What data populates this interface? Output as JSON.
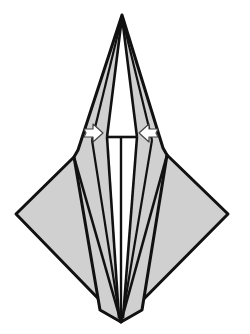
{
  "diagram": {
    "colors": {
      "paper": "#cfcfcf",
      "inner": "#ffffff",
      "stroke": "#111111",
      "background": "#ffffff"
    },
    "arrows": [
      {
        "name": "left-arrow",
        "direction": "right",
        "label": "push-in"
      },
      {
        "name": "right-arrow",
        "direction": "left",
        "label": "push-in"
      }
    ]
  }
}
